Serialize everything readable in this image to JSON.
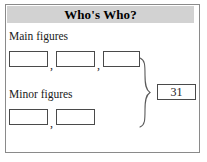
{
  "worksheet": {
    "title": "Who's Who?",
    "title_bar_color": "#d2d2d2",
    "frame_border_color": "#8a8a8a",
    "box_border_color": "#4a4a4a",
    "background_color": "#ffffff",
    "sections": [
      {
        "label": "Main figures",
        "boxes": [
          {
            "value": "",
            "placeholder": ""
          },
          {
            "value": "",
            "placeholder": ""
          },
          {
            "value": "",
            "placeholder": ""
          }
        ],
        "separators": [
          ",",
          ","
        ]
      },
      {
        "label": "Minor figures",
        "boxes": [
          {
            "value": "",
            "placeholder": ""
          },
          {
            "value": "",
            "placeholder": ""
          }
        ],
        "separators": [
          ","
        ]
      }
    ],
    "brace": {
      "icon": "right-curly-brace-icon",
      "orientation": "right"
    },
    "total": {
      "value": "31"
    }
  }
}
